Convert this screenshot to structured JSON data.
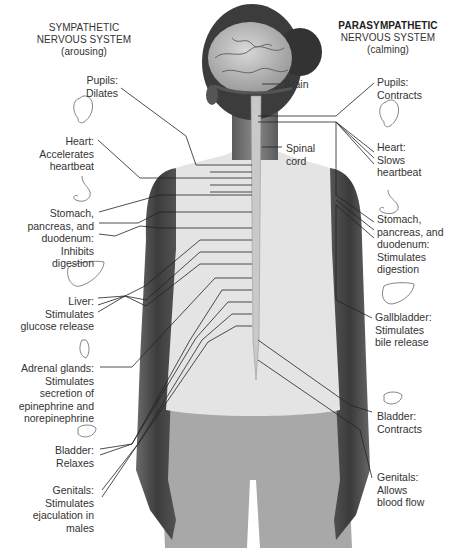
{
  "sympathetic": {
    "title_line1": "SYMPATHETIC",
    "title_line2": "NERVOUS SYSTEM",
    "subtitle": "(arousing)",
    "items": [
      {
        "organ": "pupils",
        "icon": "eye-icon",
        "lines": [
          "Pupils:",
          "Dilates"
        ]
      },
      {
        "organ": "heart",
        "icon": "heart-icon",
        "lines": [
          "Heart:",
          "Accelerates",
          "heartbeat"
        ]
      },
      {
        "organ": "stomach",
        "icon": "stomach-icon",
        "lines": [
          "Stomach,",
          "pancreas, and",
          "duodenum:",
          "Inhibits",
          "digestion"
        ]
      },
      {
        "organ": "liver",
        "icon": "liver-icon",
        "lines": [
          "Liver:",
          "Stimulates",
          "glucose release"
        ]
      },
      {
        "organ": "adrenal",
        "icon": "adrenal-gland-icon",
        "lines": [
          "Adrenal glands:",
          "Stimulates",
          "secretion of",
          "epinephrine and",
          "norepinephrine"
        ]
      },
      {
        "organ": "bladder",
        "icon": "bladder-icon",
        "lines": [
          "Bladder:",
          "Relaxes"
        ]
      },
      {
        "organ": "genitals",
        "icon": "",
        "lines": [
          "Genitals:",
          "Stimulates",
          "ejaculation in",
          "males"
        ]
      }
    ]
  },
  "parasympathetic": {
    "title_line1": "PARASYMPATHETIC",
    "title_line2": "NERVOUS SYSTEM",
    "subtitle": "(calming)",
    "items": [
      {
        "organ": "pupils",
        "icon": "",
        "lines": [
          "Pupils:",
          "Contracts"
        ]
      },
      {
        "organ": "heart",
        "icon": "heart-icon",
        "lines": [
          "Heart:",
          "Slows",
          "heartbeat"
        ]
      },
      {
        "organ": "stomach",
        "icon": "stomach-icon",
        "lines": [
          "Stomach,",
          "pancreas, and",
          "duodenum:",
          "Stimulates",
          "digestion"
        ]
      },
      {
        "organ": "gallbladder",
        "icon": "gallbladder-icon",
        "lines": [
          "Gallbladder:",
          "Stimulates",
          "bile release"
        ]
      },
      {
        "organ": "bladder",
        "icon": "bladder-icon",
        "lines": [
          "Bladder:",
          "Contracts"
        ]
      },
      {
        "organ": "genitals",
        "icon": "",
        "lines": [
          "Genitals:",
          "Allows",
          "blood flow"
        ]
      }
    ]
  },
  "anatomy": {
    "brain": "Brain",
    "spinal_line1": "Spinal",
    "spinal_line2": "cord"
  },
  "colors": {
    "skin": "#4a4a4a",
    "shirt": "#e6e6e6",
    "shorts": "#a9a9a9",
    "brain": "#bdbdbd",
    "line": "#222222",
    "text": "#333333"
  }
}
